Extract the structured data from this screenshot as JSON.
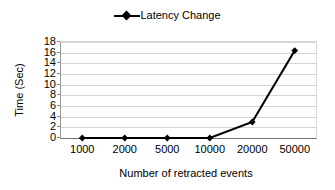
{
  "chart_data": {
    "type": "line",
    "title": "",
    "xlabel": "Number of retracted events",
    "ylabel": "Time (Sec)",
    "categories": [
      "1000",
      "2000",
      "5000",
      "10000",
      "20000",
      "50000"
    ],
    "series": [
      {
        "name": "Latency Change",
        "color": "#000000",
        "marker": "diamond",
        "values": [
          0,
          0,
          0,
          0,
          3,
          16.4
        ]
      }
    ],
    "ylim": [
      0,
      18
    ],
    "ytick_step": 2,
    "yticks": [
      "18",
      "16",
      "14",
      "12",
      "10",
      "8",
      "6",
      "4",
      "2",
      "0"
    ],
    "grid": true,
    "grid_axis": "y",
    "legend_position": "top-center",
    "legend_entries": [
      "Latency Change"
    ]
  },
  "legend": {
    "items": [
      {
        "label": "Latency Change",
        "marker": "line-diamond-marker"
      }
    ]
  },
  "axes": {
    "y_title": "Time (Sec)",
    "x_title": "Number of retracted events"
  },
  "colors": {
    "series": "#000000",
    "gridline": "#d4d4d4",
    "axis": "#6f6f6f",
    "background": "#ffffff"
  }
}
